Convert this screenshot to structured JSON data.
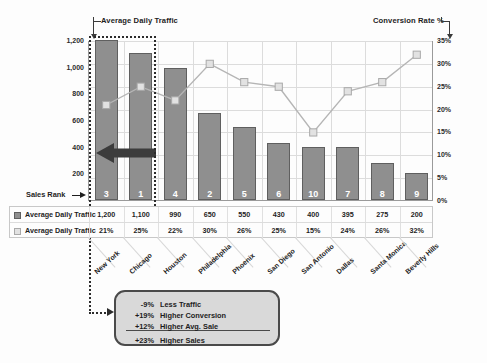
{
  "annotations": {
    "left_axis_title": "Average Daily Traffic",
    "right_axis_title": "Conversion Rate %",
    "sales_rank_label": "Sales Rank"
  },
  "legend": {
    "rows": [
      {
        "label": "Average Daily Traffic",
        "swatch": "bar-swatch"
      },
      {
        "label": "Average Daily Traffic",
        "swatch": "line-swatch"
      }
    ]
  },
  "callout": {
    "rows": [
      {
        "pct": "-9%",
        "text": "Less Traffic"
      },
      {
        "pct": "+19%",
        "text": "Higher Conversion"
      },
      {
        "pct": "+12%",
        "text": "Higher Avg. Sale"
      },
      {
        "pct": "+23%",
        "text": "Higher Sales"
      }
    ]
  },
  "chart_data": {
    "type": "bar",
    "title": "",
    "xlabel": "",
    "ylabel": "Average Daily Traffic",
    "categories": [
      "New York",
      "Chicago",
      "Houston",
      "Philadelphia",
      "Phoenix",
      "San Diego",
      "San Antonio",
      "Dallas",
      "Santa Monica",
      "Beverly Hills"
    ],
    "series": [
      {
        "name": "Average Daily Traffic",
        "type": "bar",
        "axis": "left",
        "values": [
          1200,
          1100,
          990,
          650,
          550,
          430,
          400,
          395,
          275,
          200
        ],
        "value_labels": [
          "1,200",
          "1,100",
          "990",
          "650",
          "550",
          "430",
          "400",
          "395",
          "275",
          "200"
        ]
      },
      {
        "name": "Average Daily Traffic",
        "type": "line",
        "axis": "right",
        "values": [
          21,
          25,
          22,
          30,
          26,
          25,
          15,
          24,
          26,
          32
        ],
        "value_labels": [
          "21%",
          "25%",
          "22%",
          "30%",
          "26%",
          "25%",
          "15%",
          "24%",
          "26%",
          "32%"
        ]
      }
    ],
    "sales_rank": [
      3,
      1,
      4,
      2,
      5,
      6,
      10,
      7,
      8,
      9
    ],
    "ylim": [
      0,
      1200
    ],
    "yticks": [
      200,
      400,
      600,
      800,
      1000,
      1200
    ],
    "ytick_labels": [
      "200",
      "400",
      "600",
      "800",
      "1,000",
      "1,200"
    ],
    "y2lim": [
      0,
      35
    ],
    "y2ticks": [
      0,
      5,
      10,
      15,
      20,
      25,
      30,
      35
    ],
    "y2tick_labels": [
      "0%",
      "5%",
      "10%",
      "15%",
      "20%",
      "25%",
      "30%",
      "35%"
    ],
    "grid": true,
    "legend_position": "bottom-table",
    "highlighted_categories": [
      "New York",
      "Chicago"
    ],
    "colors": {
      "bar_fill": "#8f8f8f",
      "bar_border": "#5f5f5f",
      "marker_fill": "#e2e2e2",
      "marker_border": "#a9a9a9",
      "line": "#b5b5b5",
      "highlight_box": "#2b2b2b",
      "callout_fill": "#d9d9d9",
      "callout_border": "#4a4a4a"
    }
  }
}
